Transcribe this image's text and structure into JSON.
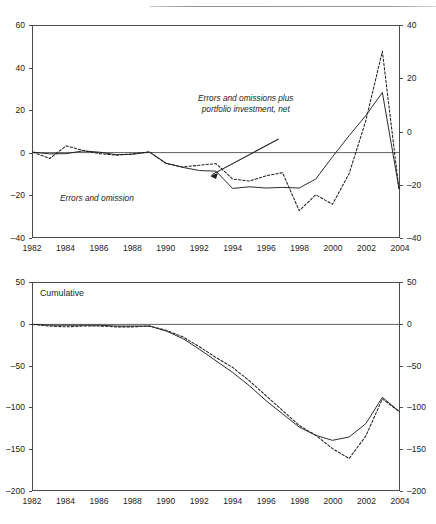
{
  "document": {
    "header_rule_visible": true,
    "header_ghost_text": ""
  },
  "figure": {
    "panels": [
      {
        "id": "top",
        "panel_label": "",
        "annotations": [
          {
            "name": "errors-and-omission-label",
            "text": "Errors and omission",
            "lines": [
              "Errors and omission"
            ]
          },
          {
            "name": "errors-omissions-plus-portfolio-label",
            "text": "Errors and omissions plus portfolio investment, net",
            "lines": [
              "Errors and omissions plus",
              "portfolio investment, net"
            ]
          }
        ]
      },
      {
        "id": "bottom",
        "panel_label": "Cumulative",
        "annotations": [
          {
            "name": "errors-and-omissions-label",
            "text": "Errors and omissions",
            "lines": [
              "Errors and omissions"
            ]
          },
          {
            "name": "errors-omissions-plus-portfolio-label",
            "text": "Errors and omissions plus portfolio investment, net",
            "lines": [
              "Errors and omissions",
              "plus portfolio",
              "investment, net"
            ]
          }
        ]
      }
    ]
  },
  "chart_data": [
    {
      "type": "line",
      "id": "annual-flows",
      "title": "",
      "subtitle": "",
      "xlabel": "",
      "ylabel": "",
      "grid": false,
      "legend": "annotations-inline",
      "xlim": [
        1982,
        2004
      ],
      "xticks": [
        1982,
        1984,
        1986,
        1988,
        1990,
        1992,
        1994,
        1996,
        1998,
        2000,
        2002,
        2004
      ],
      "xtick_labels": [
        "1982",
        "1984",
        "1986",
        "1988",
        "1990",
        "1992",
        "1994",
        "1996",
        "1998",
        "2000",
        "2002",
        "2004"
      ],
      "ylim_left": [
        -40,
        60
      ],
      "yticks_left": [
        -40,
        -20,
        0,
        20,
        40,
        60
      ],
      "ytick_labels_left": [
        "–40",
        "–20",
        "0",
        "20",
        "40",
        "60"
      ],
      "ylim_right": [
        -40,
        40
      ],
      "yticks_right": [
        -40,
        -20,
        0,
        20,
        40
      ],
      "ytick_labels_right": [
        "–40",
        "–20",
        "0",
        "20",
        "40"
      ],
      "zero_line": 0,
      "x": [
        1982,
        1983,
        1984,
        1985,
        1986,
        1987,
        1988,
        1989,
        1990,
        1991,
        1992,
        1993,
        1994,
        1995,
        1996,
        1997,
        1998,
        1999,
        2000,
        2001,
        2002,
        2003,
        2004
      ],
      "series": [
        {
          "name": "Errors and omission",
          "style": "solid",
          "axis": "left",
          "values": [
            0.2,
            -0.6,
            -0.5,
            0.8,
            0.2,
            -1.0,
            -0.8,
            0.3,
            -5.0,
            -7.0,
            -8.5,
            -8.8,
            -17.0,
            -16.2,
            -16.8,
            -16.5,
            -16.8,
            -12.5,
            -2.0,
            8.0,
            17.5,
            28.5,
            -17.0
          ]
        },
        {
          "name": "Errors and omissions plus portfolio investment, net",
          "style": "dashed",
          "axis": "left",
          "values": [
            0.2,
            -2.8,
            3.2,
            1.0,
            -0.5,
            -1.2,
            -0.6,
            0.3,
            -5.2,
            -6.8,
            -6.0,
            -5.2,
            -12.5,
            -13.5,
            -11.0,
            -9.5,
            -27.5,
            -20.0,
            -24.5,
            -10.0,
            15.0,
            48.0,
            -17.5
          ]
        }
      ]
    },
    {
      "type": "line",
      "id": "cumulative-flows",
      "title": "Cumulative",
      "subtitle": "",
      "xlabel": "",
      "ylabel": "",
      "grid": false,
      "legend": "annotations-inline",
      "xlim": [
        1982,
        2004
      ],
      "xticks": [
        1982,
        1984,
        1986,
        1988,
        1990,
        1992,
        1994,
        1996,
        1998,
        2000,
        2002,
        2004
      ],
      "xtick_labels": [
        "1982",
        "1984",
        "1986",
        "1988",
        "1990",
        "1992",
        "1994",
        "1996",
        "1998",
        "2000",
        "2002",
        "2004"
      ],
      "ylim_left": [
        -200,
        50
      ],
      "yticks_left": [
        -200,
        -150,
        -100,
        -50,
        0,
        50
      ],
      "ytick_labels_left": [
        "–200",
        "–150",
        "–100",
        "–50",
        "0",
        "50"
      ],
      "ylim_right": [
        -200,
        50
      ],
      "yticks_right": [
        -200,
        -150,
        -100,
        -50,
        0,
        50
      ],
      "ytick_labels_right": [
        "–200",
        "–150",
        "–100",
        "–50",
        "0",
        "50"
      ],
      "zero_line": 0,
      "x": [
        1982,
        1983,
        1984,
        1985,
        1986,
        1987,
        1988,
        1989,
        1990,
        1991,
        1992,
        1993,
        1994,
        1995,
        1996,
        1997,
        1998,
        1999,
        2000,
        2001,
        2002,
        2003,
        2004
      ],
      "series": [
        {
          "name": "Errors and omissions",
          "style": "solid",
          "axis": "left",
          "values": [
            0,
            -1,
            -1,
            -1,
            -1,
            -2,
            -2,
            -2,
            -8,
            -17,
            -30,
            -44,
            -58,
            -74,
            -92,
            -108,
            -124,
            -134,
            -140,
            -136,
            -120,
            -88,
            -105
          ]
        },
        {
          "name": "Errors and omissions plus portfolio investment, net",
          "style": "dashed",
          "axis": "left",
          "values": [
            0,
            -2,
            -3,
            -2,
            -2,
            -3,
            -3,
            -2,
            -7,
            -15,
            -27,
            -40,
            -52,
            -68,
            -86,
            -104,
            -122,
            -134,
            -150,
            -162,
            -135,
            -90,
            -105
          ]
        }
      ]
    }
  ]
}
